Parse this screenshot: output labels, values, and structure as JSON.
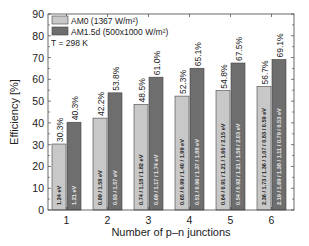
{
  "chart_data": {
    "type": "bar",
    "title": "",
    "xlabel": "Number of p–n junctions",
    "ylabel": "Efficiency [%]",
    "ylim": [
      0,
      90
    ],
    "yticks": [
      0,
      10,
      20,
      30,
      40,
      50,
      60,
      70,
      80,
      90
    ],
    "grid": false,
    "legend_position": "upper left",
    "annotation": "T = 298 K",
    "categories": [
      "1",
      "2",
      "3",
      "4",
      "5",
      "6"
    ],
    "series": [
      {
        "name": "AM0 (1367 W/m²)",
        "color": "#c8c8c8",
        "values": [
          30.3,
          42.2,
          48.5,
          52.3,
          54.8,
          56.7
        ],
        "value_labels": [
          "30.3%",
          "42.2%",
          "48.5%",
          "52.3%",
          "54.8%",
          "56.7%"
        ],
        "bandgap_labels": [
          "1.24 eV",
          "0.89 / 1.58 eV",
          "0.74 / 1.18 / 1.82 eV",
          "0.65 / 0.99 / 1.40 / 1.99 eV",
          "0.64 / 0.91 / 1.21 / 1.60 / 2.15 eV",
          "2.36 / 1.73 / 1.36 / 1.07 / 0.83 / 0.59 eV"
        ]
      },
      {
        "name": "AM1.5d (500x1000 W/m²)",
        "color": "#6e6e6e",
        "values": [
          40.3,
          53.8,
          61.0,
          65.1,
          67.5,
          69.1
        ],
        "value_labels": [
          "40.3%",
          "53.8%",
          "61.0%",
          "65.1%",
          "67.5%",
          "69.1%"
        ],
        "bandgap_labels": [
          "1.21 eV",
          "0.93 / 1.57 eV",
          "0.69 / 1.17 / 1.74 eV",
          "0.51 / 0.96 / 1.37 / 1.88 eV",
          "0.54 / 0.92 / 1.21 / 1.56 / 2.03 eV",
          "2.19 / 1.69 / 1.38 / 1.11 / 0.79 / 0.53 eV"
        ]
      }
    ]
  }
}
